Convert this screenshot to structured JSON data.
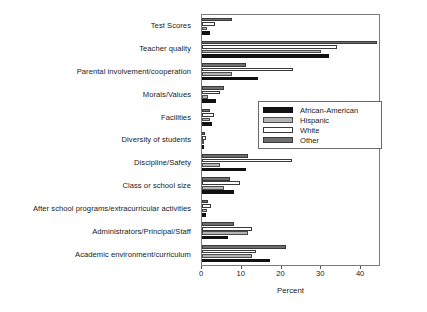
{
  "chart_data": {
    "type": "bar",
    "orientation": "horizontal",
    "title": "",
    "xlabel": "Percent",
    "ylabel": "",
    "xlim": [
      0,
      45
    ],
    "xticks": [
      0,
      10,
      20,
      30,
      40
    ],
    "grid": false,
    "legend_position": "center-right",
    "categories": [
      "Test Scores",
      "Teacher quality",
      "Parental involvement/cooperation",
      "Morals/Values",
      "Facilities",
      "Diversity of students",
      "Discipline/Safety",
      "Class or school size",
      "After school programs/extracurricular activities",
      "Administrators/Principal/Staff",
      "Academic environment/curriculum"
    ],
    "series": [
      {
        "name": "African-American",
        "color": "#111111",
        "values": [
          2.0,
          32.0,
          14.0,
          3.5,
          2.5,
          0.6,
          11.0,
          8.0,
          1.0,
          6.5,
          17.0
        ]
      },
      {
        "name": "Hispanic",
        "color": "#b4b4b4",
        "values": [
          1.2,
          30.0,
          7.5,
          1.5,
          2.0,
          0.5,
          4.5,
          5.5,
          1.2,
          11.5,
          12.5
        ]
      },
      {
        "name": "White",
        "color": "#ffffff",
        "values": [
          3.2,
          34.0,
          23.0,
          4.5,
          3.0,
          1.0,
          22.5,
          9.5,
          2.2,
          12.5,
          13.5
        ]
      },
      {
        "name": "Other",
        "color": "#6e6e6e",
        "values": [
          7.5,
          44.0,
          11.0,
          5.5,
          2.0,
          0.8,
          11.5,
          7.0,
          1.5,
          8.0,
          21.0
        ]
      }
    ]
  }
}
